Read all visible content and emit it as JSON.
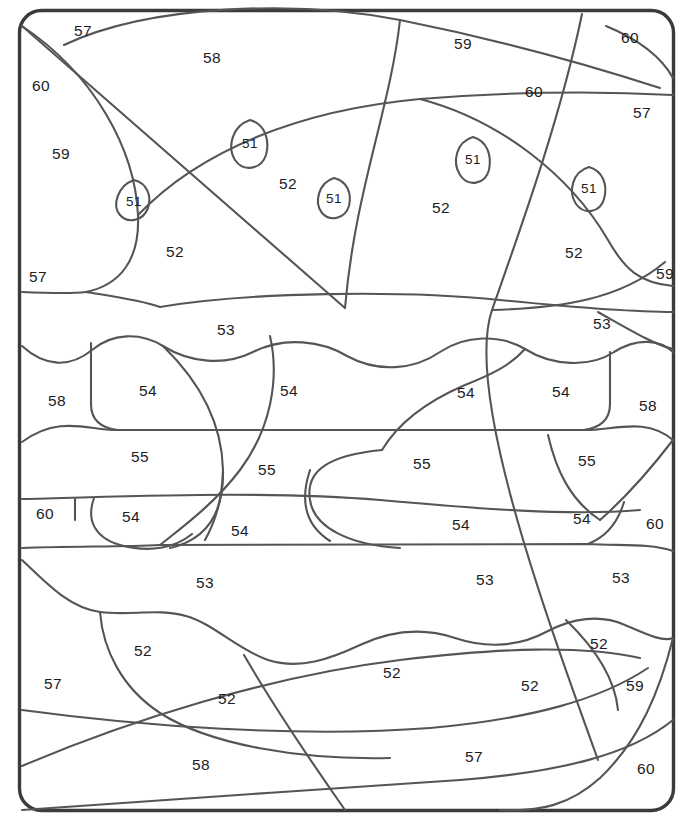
{
  "page": {
    "width": 693,
    "height": 821,
    "background_color": "#ffffff",
    "line_color": "#555558",
    "frame_color": "#3b3b3e",
    "number_color": "#1d1d1f"
  },
  "legend_values": [
    "51",
    "52",
    "53",
    "54",
    "55",
    "57",
    "58",
    "59",
    "60"
  ],
  "regions": [
    {
      "label": "57",
      "x": 83,
      "y": 31,
      "kind": "background"
    },
    {
      "label": "58",
      "x": 212,
      "y": 58,
      "kind": "bun-top"
    },
    {
      "label": "59",
      "x": 463,
      "y": 44,
      "kind": "background"
    },
    {
      "label": "60",
      "x": 630,
      "y": 38,
      "kind": "background"
    },
    {
      "label": "60",
      "x": 41,
      "y": 86,
      "kind": "background"
    },
    {
      "label": "60",
      "x": 534,
      "y": 92,
      "kind": "background"
    },
    {
      "label": "57",
      "x": 642,
      "y": 113,
      "kind": "background"
    },
    {
      "label": "59",
      "x": 61,
      "y": 154,
      "kind": "background"
    },
    {
      "label": "51",
      "x": 250,
      "y": 143,
      "kind": "sesame-seed"
    },
    {
      "label": "51",
      "x": 473,
      "y": 159,
      "kind": "sesame-seed"
    },
    {
      "label": "52",
      "x": 288,
      "y": 184,
      "kind": "bun-top"
    },
    {
      "label": "51",
      "x": 334,
      "y": 198,
      "kind": "sesame-seed"
    },
    {
      "label": "51",
      "x": 589,
      "y": 188,
      "kind": "sesame-seed"
    },
    {
      "label": "51",
      "x": 134,
      "y": 201,
      "kind": "sesame-seed"
    },
    {
      "label": "52",
      "x": 441,
      "y": 208,
      "kind": "bun-top"
    },
    {
      "label": "52",
      "x": 175,
      "y": 252,
      "kind": "bun-top"
    },
    {
      "label": "52",
      "x": 574,
      "y": 253,
      "kind": "bun-top"
    },
    {
      "label": "57",
      "x": 38,
      "y": 277,
      "kind": "background"
    },
    {
      "label": "59",
      "x": 665,
      "y": 274,
      "kind": "background"
    },
    {
      "label": "53",
      "x": 226,
      "y": 330,
      "kind": "cheese"
    },
    {
      "label": "53",
      "x": 602,
      "y": 324,
      "kind": "cheese"
    },
    {
      "label": "58",
      "x": 57,
      "y": 401,
      "kind": "background"
    },
    {
      "label": "54",
      "x": 148,
      "y": 391,
      "kind": "lettuce"
    },
    {
      "label": "54",
      "x": 289,
      "y": 391,
      "kind": "lettuce"
    },
    {
      "label": "54",
      "x": 466,
      "y": 393,
      "kind": "lettuce"
    },
    {
      "label": "54",
      "x": 561,
      "y": 392,
      "kind": "lettuce"
    },
    {
      "label": "58",
      "x": 648,
      "y": 406,
      "kind": "background"
    },
    {
      "label": "55",
      "x": 140,
      "y": 457,
      "kind": "tomato"
    },
    {
      "label": "55",
      "x": 267,
      "y": 470,
      "kind": "tomato"
    },
    {
      "label": "55",
      "x": 422,
      "y": 464,
      "kind": "tomato"
    },
    {
      "label": "55",
      "x": 587,
      "y": 461,
      "kind": "tomato"
    },
    {
      "label": "60",
      "x": 45,
      "y": 514,
      "kind": "background"
    },
    {
      "label": "54",
      "x": 131,
      "y": 517,
      "kind": "lettuce"
    },
    {
      "label": "54",
      "x": 240,
      "y": 531,
      "kind": "lettuce"
    },
    {
      "label": "54",
      "x": 461,
      "y": 525,
      "kind": "lettuce"
    },
    {
      "label": "54",
      "x": 582,
      "y": 519,
      "kind": "lettuce"
    },
    {
      "label": "60",
      "x": 655,
      "y": 524,
      "kind": "background"
    },
    {
      "label": "53",
      "x": 205,
      "y": 583,
      "kind": "patty"
    },
    {
      "label": "53",
      "x": 485,
      "y": 580,
      "kind": "patty"
    },
    {
      "label": "53",
      "x": 621,
      "y": 578,
      "kind": "patty"
    },
    {
      "label": "52",
      "x": 143,
      "y": 651,
      "kind": "bun-bottom"
    },
    {
      "label": "52",
      "x": 599,
      "y": 644,
      "kind": "bun-bottom"
    },
    {
      "label": "52",
      "x": 392,
      "y": 673,
      "kind": "bun-bottom"
    },
    {
      "label": "57",
      "x": 53,
      "y": 684,
      "kind": "background"
    },
    {
      "label": "52",
      "x": 227,
      "y": 699,
      "kind": "bun-bottom"
    },
    {
      "label": "52",
      "x": 530,
      "y": 686,
      "kind": "bun-bottom"
    },
    {
      "label": "59",
      "x": 635,
      "y": 686,
      "kind": "background"
    },
    {
      "label": "58",
      "x": 201,
      "y": 765,
      "kind": "background"
    },
    {
      "label": "57",
      "x": 474,
      "y": 757,
      "kind": "background"
    },
    {
      "label": "60",
      "x": 646,
      "y": 769,
      "kind": "background"
    }
  ],
  "seeds": [
    {
      "cx": 250,
      "cy": 143,
      "rx": 18,
      "ry": 23,
      "rot": -18
    },
    {
      "cx": 473,
      "cy": 159,
      "rx": 17,
      "ry": 22,
      "rot": 12
    },
    {
      "cx": 334,
      "cy": 198,
      "rx": 15,
      "ry": 20,
      "rot": -8
    },
    {
      "cx": 589,
      "cy": 188,
      "rx": 16,
      "ry": 21,
      "rot": 14
    },
    {
      "cx": 134,
      "cy": 201,
      "rx": 17,
      "ry": 21,
      "rot": -30
    }
  ]
}
